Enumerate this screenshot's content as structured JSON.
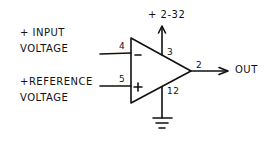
{
  "diagram": {
    "type": "op-amp comparator schematic",
    "inputs": {
      "inverting": {
        "label_line1": "+ INPUT",
        "label_line2": "VOLTAGE",
        "pin": "4",
        "symbol": "−"
      },
      "non_inverting": {
        "label_line1": "+REFERENCE",
        "label_line2": "VOLTAGE",
        "pin": "5",
        "symbol": "+"
      }
    },
    "supply": {
      "label": "+ 2-32",
      "pin": "3"
    },
    "ground": {
      "pin": "12"
    },
    "output": {
      "label": "OUT",
      "pin": "2"
    },
    "colors": {
      "ink": "#111111",
      "background": "#ffffff"
    }
  }
}
